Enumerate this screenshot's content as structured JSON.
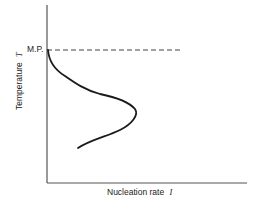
{
  "diagram": {
    "y_axis_label": "Temperature",
    "y_axis_symbol": "T",
    "x_axis_label": "Nucleation rate",
    "x_axis_symbol": "I",
    "melting_point_label": "M.P.",
    "curve_description": "Nucleation rate vs temperature: zero at melting point, rises to a maximum below M.P., then decreases at lower temperatures"
  },
  "colors": {
    "line": "#1a1a1a",
    "dashed": "#444444",
    "text": "#222222",
    "background": "#ffffff"
  }
}
